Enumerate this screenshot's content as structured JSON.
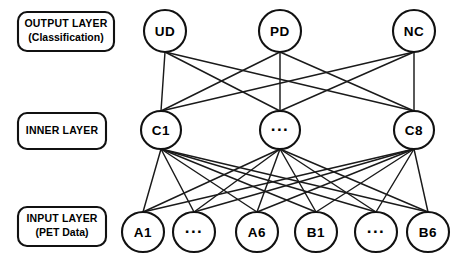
{
  "diagram": {
    "background_color": "#ffffff",
    "stroke_color": "#111111",
    "edge_color": "#1a1a1a",
    "width": 467,
    "height": 261
  },
  "layer_labels": [
    {
      "id": "output-layer-label",
      "line1": "OUTPUT LAYER",
      "line2": "(Classification)",
      "x": 18,
      "y": 12,
      "w": 96,
      "h": 39
    },
    {
      "id": "inner-layer-label",
      "line1": "INNER LAYER",
      "line2": "",
      "x": 18,
      "y": 113,
      "w": 88,
      "h": 36
    },
    {
      "id": "input-layer-label",
      "line1": "INPUT LAYER",
      "line2": "(PET Data)",
      "x": 18,
      "y": 207,
      "w": 88,
      "h": 39
    }
  ],
  "layers": {
    "output": {
      "name": "output",
      "cy": 31,
      "rx": 21,
      "ry": 21,
      "nodes": [
        {
          "id": "node-ud",
          "label": "UD",
          "cx": 165,
          "ellipsis": false
        },
        {
          "id": "node-pd",
          "label": "PD",
          "cx": 280,
          "ellipsis": false
        },
        {
          "id": "node-nc",
          "label": "NC",
          "cx": 414,
          "ellipsis": false
        }
      ]
    },
    "inner": {
      "name": "inner",
      "cy": 130,
      "rx": 20,
      "ry": 19,
      "nodes": [
        {
          "id": "node-c1",
          "label": "C1",
          "cx": 161,
          "ellipsis": false
        },
        {
          "id": "node-cmid",
          "label": "...",
          "cx": 280,
          "ellipsis": true
        },
        {
          "id": "node-c8",
          "label": "C8",
          "cx": 414,
          "ellipsis": false
        }
      ]
    },
    "input": {
      "name": "input",
      "cy": 232,
      "rx": 21,
      "ry": 20,
      "nodes": [
        {
          "id": "node-a1",
          "label": "A1",
          "cx": 143,
          "ellipsis": false
        },
        {
          "id": "node-amid",
          "label": "...",
          "cx": 194,
          "ellipsis": true
        },
        {
          "id": "node-a6",
          "label": "A6",
          "cx": 257,
          "ellipsis": false
        },
        {
          "id": "node-b1",
          "label": "B1",
          "cx": 316,
          "ellipsis": false
        },
        {
          "id": "node-bmid",
          "label": "...",
          "cx": 376,
          "ellipsis": true
        },
        {
          "id": "node-b6",
          "label": "B6",
          "cx": 428,
          "ellipsis": false
        }
      ]
    }
  },
  "connections": {
    "output_to_inner": "fully-connected",
    "inner_to_input": "fully-connected",
    "output_to_inner_count": 9,
    "inner_to_input_count": 18
  }
}
